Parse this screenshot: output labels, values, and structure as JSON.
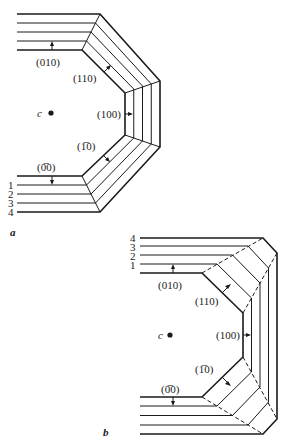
{
  "figure": {
    "panel_a": {
      "label": "a",
      "center_label": "c",
      "face_labels": {
        "top": "(010)",
        "upper_diag": "(110)",
        "right": "(100)",
        "lower_diag": "(1̄1̄0)",
        "bottom": "(0̄1̄0)"
      },
      "stage_numbers": [
        "1",
        "2",
        "3",
        "4"
      ]
    },
    "panel_b": {
      "label": "b",
      "center_label": "c",
      "face_labels": {
        "top": "(010)",
        "upper_diag": "(110)",
        "right": "(100)",
        "lower_diag": "(1̄1̄0)",
        "bottom": "(0̄1̄0)"
      },
      "stage_numbers": [
        "4",
        "3",
        "2",
        "1"
      ]
    }
  },
  "labels": {
    "a": "a",
    "b": "b",
    "c": "c",
    "f010": "(010)",
    "f110": "(110)",
    "f100": "(100)",
    "f1m10": "(1̅0)",
    "f0m10": "(0̅0)",
    "n1": "1",
    "n2": "2",
    "n3": "3",
    "n4": "4"
  },
  "colors": {
    "ink": "#1a1a1a",
    "background": "#ffffff"
  }
}
